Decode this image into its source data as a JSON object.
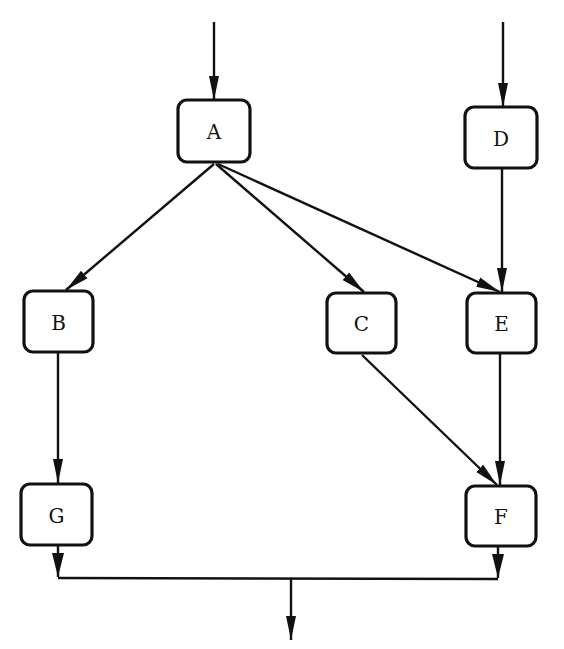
{
  "diagram": {
    "type": "flow-graph",
    "nodes": [
      {
        "id": "A",
        "label": "A",
        "x": 178,
        "y": 100,
        "w": 72,
        "h": 62
      },
      {
        "id": "D",
        "label": "D",
        "x": 465,
        "y": 107,
        "w": 72,
        "h": 61
      },
      {
        "id": "B",
        "label": "B",
        "x": 24,
        "y": 291,
        "w": 69,
        "h": 61
      },
      {
        "id": "C",
        "label": "C",
        "x": 327,
        "y": 293,
        "w": 69,
        "h": 60
      },
      {
        "id": "E",
        "label": "E",
        "x": 467,
        "y": 293,
        "w": 69,
        "h": 60
      },
      {
        "id": "G",
        "label": "G",
        "x": 21,
        "y": 484,
        "w": 71,
        "h": 61
      },
      {
        "id": "F",
        "label": "F",
        "x": 466,
        "y": 486,
        "w": 70,
        "h": 60
      }
    ],
    "edges": [
      {
        "from": "entry-top-left",
        "to": "A"
      },
      {
        "from": "entry-top-right",
        "to": "D"
      },
      {
        "from": "A",
        "to": "B"
      },
      {
        "from": "A",
        "to": "C"
      },
      {
        "from": "A",
        "to": "E"
      },
      {
        "from": "D",
        "to": "E"
      },
      {
        "from": "B",
        "to": "G"
      },
      {
        "from": "C",
        "to": "F"
      },
      {
        "from": "E",
        "to": "F"
      },
      {
        "from": "G",
        "to": "merge-bus"
      },
      {
        "from": "F",
        "to": "merge-bus"
      },
      {
        "from": "merge-bus",
        "to": "exit-bottom"
      }
    ]
  }
}
